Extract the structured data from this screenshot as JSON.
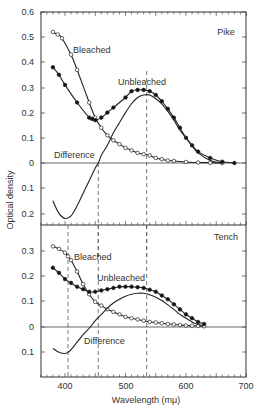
{
  "chart_data": [
    {
      "type": "line",
      "panel": "Pike",
      "title": "Pike",
      "xlabel": "Wavelength (mμ)",
      "ylabel": "Optical density",
      "xlim": [
        360,
        700
      ],
      "ylim": [
        -0.25,
        0.6
      ],
      "yticks": [
        0.6,
        0.5,
        0.4,
        0.3,
        0.2,
        0.1,
        0,
        0.1,
        0.2
      ],
      "ytick_values": [
        0.6,
        0.5,
        0.4,
        0.3,
        0.2,
        0.1,
        0,
        -0.1,
        -0.2
      ],
      "dashed_verticals": [
        455,
        535
      ],
      "series": [
        {
          "name": "Bleached",
          "marker": "open-circle",
          "x": [
            380,
            388,
            395,
            410,
            420,
            440,
            450,
            460,
            470,
            480,
            490,
            500,
            510,
            520,
            530,
            540,
            550,
            560,
            570,
            580,
            600,
            620,
            640,
            660
          ],
          "y": [
            0.52,
            0.51,
            0.495,
            0.43,
            0.37,
            0.24,
            0.18,
            0.14,
            0.11,
            0.09,
            0.075,
            0.06,
            0.05,
            0.04,
            0.035,
            0.03,
            0.02,
            0.015,
            0.01,
            0.008,
            0.004,
            0.002,
            0.001,
            0.0
          ]
        },
        {
          "name": "Unbleached",
          "marker": "filled-circle",
          "x": [
            380,
            390,
            400,
            420,
            440,
            445,
            450,
            460,
            470,
            480,
            500,
            510,
            520,
            530,
            540,
            550,
            560,
            570,
            580,
            590,
            600,
            610,
            620,
            640,
            660,
            680
          ],
          "y": [
            0.38,
            0.35,
            0.31,
            0.24,
            0.18,
            0.175,
            0.17,
            0.18,
            0.2,
            0.22,
            0.26,
            0.285,
            0.29,
            0.29,
            0.285,
            0.27,
            0.245,
            0.215,
            0.18,
            0.14,
            0.1,
            0.07,
            0.045,
            0.02,
            0.005,
            0.0
          ]
        },
        {
          "name": "Difference",
          "marker": "none",
          "x": [
            380,
            390,
            400,
            410,
            420,
            430,
            440,
            450,
            455,
            460,
            470,
            480,
            490,
            500,
            510,
            520,
            530,
            540,
            550,
            560,
            570,
            580,
            590,
            600,
            610,
            620,
            640,
            660
          ],
          "y": [
            -0.15,
            -0.2,
            -0.22,
            -0.21,
            -0.17,
            -0.12,
            -0.07,
            -0.02,
            0.0,
            0.03,
            0.07,
            0.12,
            0.16,
            0.2,
            0.235,
            0.26,
            0.27,
            0.27,
            0.255,
            0.235,
            0.205,
            0.17,
            0.13,
            0.1,
            0.068,
            0.04,
            0.01,
            0.0
          ]
        }
      ]
    },
    {
      "type": "line",
      "panel": "Tench",
      "title": "Tench",
      "xlabel": "Wavelength (mμ)",
      "ylabel": "Optical density",
      "xlim": [
        360,
        700
      ],
      "ylim": [
        -0.2,
        0.36
      ],
      "yticks": [
        0.3,
        0.2,
        0.1,
        0,
        0.1
      ],
      "ytick_values": [
        0.3,
        0.2,
        0.1,
        0,
        -0.1
      ],
      "xticks": [
        400,
        500,
        600,
        700
      ],
      "dashed_verticals": [
        405,
        455,
        535
      ],
      "series": [
        {
          "name": "Bleached",
          "marker": "open-circle",
          "x": [
            380,
            390,
            400,
            405,
            410,
            420,
            430,
            440,
            450,
            460,
            470,
            480,
            490,
            500,
            510,
            520,
            530,
            540,
            550,
            560,
            570,
            580,
            590,
            600,
            610,
            620,
            630
          ],
          "y": [
            0.32,
            0.31,
            0.295,
            0.28,
            0.265,
            0.22,
            0.17,
            0.13,
            0.1,
            0.085,
            0.07,
            0.06,
            0.05,
            0.04,
            0.035,
            0.03,
            0.025,
            0.02,
            0.018,
            0.015,
            0.012,
            0.01,
            0.008,
            0.006,
            0.005,
            0.004,
            0.003
          ]
        },
        {
          "name": "Unbleached",
          "marker": "filled-circle",
          "x": [
            380,
            390,
            400,
            410,
            420,
            430,
            440,
            450,
            460,
            470,
            480,
            490,
            500,
            510,
            520,
            530,
            540,
            550,
            560,
            570,
            580,
            590,
            600,
            610,
            620,
            630
          ],
          "y": [
            0.235,
            0.215,
            0.19,
            0.175,
            0.16,
            0.15,
            0.14,
            0.14,
            0.145,
            0.15,
            0.155,
            0.16,
            0.16,
            0.16,
            0.158,
            0.155,
            0.148,
            0.14,
            0.125,
            0.11,
            0.09,
            0.07,
            0.05,
            0.035,
            0.02,
            0.012
          ]
        },
        {
          "name": "Difference",
          "marker": "none",
          "x": [
            380,
            390,
            400,
            405,
            410,
            420,
            430,
            440,
            450,
            460,
            470,
            480,
            490,
            500,
            510,
            520,
            530,
            540,
            550,
            560,
            570,
            580,
            590,
            600,
            610,
            620,
            630
          ],
          "y": [
            -0.085,
            -0.1,
            -0.105,
            -0.1,
            -0.09,
            -0.06,
            -0.03,
            -0.005,
            0.025,
            0.05,
            0.075,
            0.095,
            0.11,
            0.122,
            0.13,
            0.134,
            0.134,
            0.128,
            0.118,
            0.105,
            0.088,
            0.07,
            0.05,
            0.035,
            0.02,
            0.01,
            0.005
          ]
        }
      ]
    }
  ],
  "labels": {
    "pike": "Pike",
    "tench": "Tench",
    "bleached": "Bleached",
    "unbleached": "Unbleached",
    "difference": "Difference",
    "ylabel": "Optical density",
    "xlabel": "Wavelength (mμ)",
    "pike_yticks": [
      "0.6",
      "0.5",
      "0.4",
      "0.3",
      "0.2",
      "0.1",
      "0",
      "0.1",
      "0.2"
    ],
    "tench_yticks": [
      "0.3",
      "0.2",
      "0.1",
      "0",
      "0.1"
    ],
    "xticks": [
      "400",
      "500",
      "600",
      "700"
    ]
  }
}
